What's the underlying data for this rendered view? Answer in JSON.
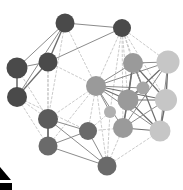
{
  "figure": {
    "background": "#ffffff",
    "width": 183,
    "height": 190
  },
  "chart_data": {
    "type": "scatter",
    "title": "",
    "subtitle": "",
    "xlabel": "",
    "ylabel": "",
    "grid": false,
    "legend": null,
    "axis_visible": false,
    "palette": {
      "node_dark": "#4a4a4a",
      "node_mid": "#9a9a9a",
      "node_light": "#c6c6c6",
      "edge_solid": "#8c8c8c",
      "edge_dashed": "#c0c0c0",
      "edge_strong": "#6e6e6e",
      "marker_black": "#000000"
    },
    "node_count": 18,
    "edge_count": 62,
    "nodes": [
      {
        "id": "n0",
        "label": "",
        "x": 65,
        "y": 23,
        "r": 9.5,
        "shade": "dark",
        "color": "#4a4a4a"
      },
      {
        "id": "n1",
        "label": "",
        "x": 122,
        "y": 28,
        "r": 9.0,
        "shade": "dark",
        "color": "#4a4a4a"
      },
      {
        "id": "n2",
        "label": "",
        "x": 48,
        "y": 62,
        "r": 9.5,
        "shade": "dark",
        "color": "#4a4a4a"
      },
      {
        "id": "n3",
        "label": "",
        "x": 17,
        "y": 68,
        "r": 10.5,
        "shade": "dark",
        "color": "#4a4a4a"
      },
      {
        "id": "n4",
        "label": "",
        "x": 17,
        "y": 97,
        "r": 10.0,
        "shade": "dark",
        "color": "#4a4a4a"
      },
      {
        "id": "n5",
        "label": "",
        "x": 96,
        "y": 86,
        "r": 10.0,
        "shade": "mid",
        "color": "#9a9a9a"
      },
      {
        "id": "n6",
        "label": "",
        "x": 133,
        "y": 63,
        "r": 10.0,
        "shade": "mid",
        "color": "#9a9a9a"
      },
      {
        "id": "n7",
        "label": "",
        "x": 168,
        "y": 62,
        "r": 11.5,
        "shade": "light",
        "color": "#c6c6c6"
      },
      {
        "id": "n8",
        "label": "",
        "x": 128,
        "y": 100,
        "r": 10.5,
        "shade": "mid",
        "color": "#9a9a9a"
      },
      {
        "id": "n9",
        "label": "",
        "x": 166,
        "y": 100,
        "r": 11.0,
        "shade": "light",
        "color": "#c6c6c6"
      },
      {
        "id": "n10",
        "label": "",
        "x": 123,
        "y": 128,
        "r": 10.0,
        "shade": "mid",
        "color": "#9a9a9a"
      },
      {
        "id": "n11",
        "label": "",
        "x": 160,
        "y": 131,
        "r": 10.5,
        "shade": "light",
        "color": "#c6c6c6"
      },
      {
        "id": "n12",
        "label": "",
        "x": 48,
        "y": 119,
        "r": 10.0,
        "shade": "dark",
        "color": "#5b5b5b"
      },
      {
        "id": "n13",
        "label": "",
        "x": 48,
        "y": 146,
        "r": 9.5,
        "shade": "dark",
        "color": "#6a6a6a"
      },
      {
        "id": "n14",
        "label": "",
        "x": 88,
        "y": 131,
        "r": 9.0,
        "shade": "dark",
        "color": "#6a6a6a"
      },
      {
        "id": "n15",
        "label": "",
        "x": 107,
        "y": 166,
        "r": 9.5,
        "shade": "dark",
        "color": "#6a6a6a"
      },
      {
        "id": "n16",
        "label": "",
        "x": 143,
        "y": 88,
        "r": 6.5,
        "shade": "mid",
        "color": "#a6a6a6"
      },
      {
        "id": "n17",
        "label": "",
        "x": 110,
        "y": 112,
        "r": 6.0,
        "shade": "mid",
        "color": "#b0b0b0"
      }
    ],
    "edges": [
      {
        "source": "n0",
        "target": "n1",
        "style": "solid",
        "weight": 1
      },
      {
        "source": "n0",
        "target": "n2",
        "style": "solid",
        "weight": 1.4
      },
      {
        "source": "n0",
        "target": "n3",
        "style": "solid",
        "weight": 1
      },
      {
        "source": "n0",
        "target": "n4",
        "style": "solid",
        "weight": 1
      },
      {
        "source": "n0",
        "target": "n5",
        "style": "dashed",
        "weight": 1
      },
      {
        "source": "n0",
        "target": "n12",
        "style": "dashed",
        "weight": 1
      },
      {
        "source": "n1",
        "target": "n2",
        "style": "solid",
        "weight": 1
      },
      {
        "source": "n1",
        "target": "n5",
        "style": "dashed",
        "weight": 1
      },
      {
        "source": "n1",
        "target": "n6",
        "style": "dashed",
        "weight": 1
      },
      {
        "source": "n1",
        "target": "n7",
        "style": "dashed",
        "weight": 1
      },
      {
        "source": "n1",
        "target": "n8",
        "style": "dashed",
        "weight": 1
      },
      {
        "source": "n1",
        "target": "n9",
        "style": "dashed",
        "weight": 1
      },
      {
        "source": "n1",
        "target": "n10",
        "style": "dashed",
        "weight": 1
      },
      {
        "source": "n1",
        "target": "n16",
        "style": "dashed",
        "weight": 1
      },
      {
        "source": "n1",
        "target": "n17",
        "style": "dashed",
        "weight": 1
      },
      {
        "source": "n2",
        "target": "n3",
        "style": "solid",
        "weight": 1
      },
      {
        "source": "n2",
        "target": "n4",
        "style": "solid",
        "weight": 1.3
      },
      {
        "source": "n2",
        "target": "n5",
        "style": "dashed",
        "weight": 1
      },
      {
        "source": "n2",
        "target": "n12",
        "style": "dashed",
        "weight": 1
      },
      {
        "source": "n2",
        "target": "n13",
        "style": "dashed",
        "weight": 1
      },
      {
        "source": "n3",
        "target": "n4",
        "style": "solid",
        "weight": 1.6
      },
      {
        "source": "n3",
        "target": "n12",
        "style": "dashed",
        "weight": 1
      },
      {
        "source": "n4",
        "target": "n12",
        "style": "dashed",
        "weight": 1
      },
      {
        "source": "n4",
        "target": "n13",
        "style": "dashed",
        "weight": 1
      },
      {
        "source": "n4",
        "target": "n14",
        "style": "dashed",
        "weight": 1
      },
      {
        "source": "n5",
        "target": "n6",
        "style": "solid",
        "weight": 1
      },
      {
        "source": "n5",
        "target": "n7",
        "style": "solid",
        "weight": 1
      },
      {
        "source": "n5",
        "target": "n8",
        "style": "solid",
        "weight": 1.2
      },
      {
        "source": "n5",
        "target": "n9",
        "style": "solid",
        "weight": 1.2
      },
      {
        "source": "n5",
        "target": "n10",
        "style": "solid",
        "weight": 1
      },
      {
        "source": "n5",
        "target": "n11",
        "style": "solid",
        "weight": 1
      },
      {
        "source": "n5",
        "target": "n12",
        "style": "dashed",
        "weight": 1
      },
      {
        "source": "n5",
        "target": "n13",
        "style": "dashed",
        "weight": 1
      },
      {
        "source": "n5",
        "target": "n14",
        "style": "dashed",
        "weight": 1
      },
      {
        "source": "n5",
        "target": "n15",
        "style": "dashed",
        "weight": 1
      },
      {
        "source": "n5",
        "target": "n16",
        "style": "solid",
        "weight": 1
      },
      {
        "source": "n5",
        "target": "n17",
        "style": "solid",
        "weight": 1
      },
      {
        "source": "n6",
        "target": "n7",
        "style": "solid",
        "weight": 1
      },
      {
        "source": "n6",
        "target": "n8",
        "style": "solid",
        "weight": 1.4
      },
      {
        "source": "n6",
        "target": "n9",
        "style": "solid",
        "weight": 1.2
      },
      {
        "source": "n6",
        "target": "n10",
        "style": "solid",
        "weight": 1.2
      },
      {
        "source": "n6",
        "target": "n11",
        "style": "solid",
        "weight": 1.2
      },
      {
        "source": "n6",
        "target": "n16",
        "style": "solid",
        "weight": 1
      },
      {
        "source": "n7",
        "target": "n8",
        "style": "solid",
        "weight": 1.2
      },
      {
        "source": "n7",
        "target": "n9",
        "style": "solid",
        "weight": 1.4
      },
      {
        "source": "n7",
        "target": "n10",
        "style": "solid",
        "weight": 1
      },
      {
        "source": "n7",
        "target": "n11",
        "style": "solid",
        "weight": 1
      },
      {
        "source": "n8",
        "target": "n9",
        "style": "solid",
        "weight": 1.2
      },
      {
        "source": "n8",
        "target": "n10",
        "style": "solid",
        "weight": 1.2
      },
      {
        "source": "n8",
        "target": "n11",
        "style": "solid",
        "weight": 1.2
      },
      {
        "source": "n8",
        "target": "n16",
        "style": "solid",
        "weight": 1
      },
      {
        "source": "n9",
        "target": "n10",
        "style": "solid",
        "weight": 1
      },
      {
        "source": "n9",
        "target": "n11",
        "style": "solid",
        "weight": 1.4
      },
      {
        "source": "n10",
        "target": "n11",
        "style": "solid",
        "weight": 1.2
      },
      {
        "source": "n10",
        "target": "n14",
        "style": "dashed",
        "weight": 1
      },
      {
        "source": "n10",
        "target": "n15",
        "style": "dashed",
        "weight": 1
      },
      {
        "source": "n11",
        "target": "n15",
        "style": "dashed",
        "weight": 1
      },
      {
        "source": "n12",
        "target": "n13",
        "style": "solid",
        "weight": 1.8
      },
      {
        "source": "n12",
        "target": "n14",
        "style": "solid",
        "weight": 1
      },
      {
        "source": "n12",
        "target": "n15",
        "style": "solid",
        "weight": 1
      },
      {
        "source": "n13",
        "target": "n14",
        "style": "solid",
        "weight": 1
      },
      {
        "source": "n13",
        "target": "n15",
        "style": "solid",
        "weight": 1
      },
      {
        "source": "n14",
        "target": "n15",
        "style": "solid",
        "weight": 1
      },
      {
        "source": "n14",
        "target": "n17",
        "style": "dashed",
        "weight": 1
      },
      {
        "source": "n15",
        "target": "n17",
        "style": "dashed",
        "weight": 1
      }
    ],
    "annotations": [
      {
        "id": "a0",
        "kind": "triangle-marker",
        "x": 0,
        "y": 167,
        "width": 11,
        "height": 13,
        "color": "#000000"
      },
      {
        "id": "a1",
        "kind": "bar-marker",
        "x": 0,
        "y": 183,
        "width": 12,
        "height": 7,
        "color": "#000000"
      }
    ]
  }
}
